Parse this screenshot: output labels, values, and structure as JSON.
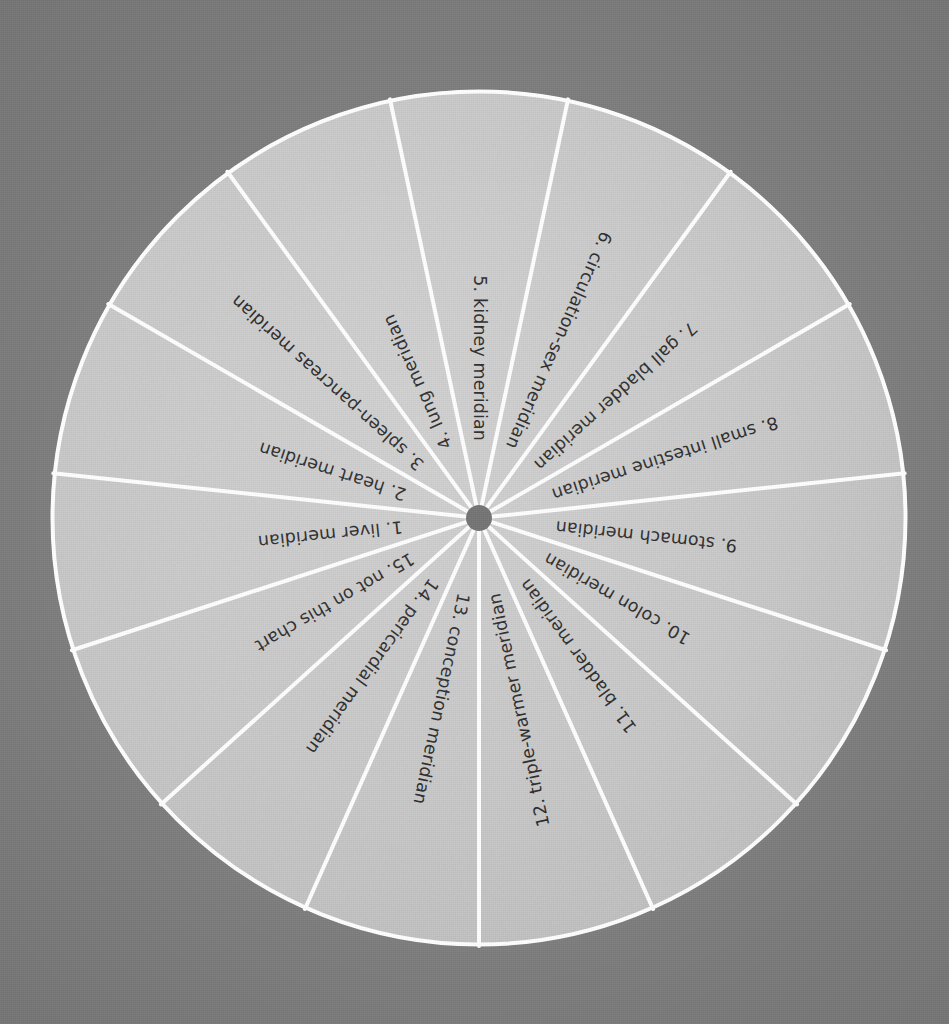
{
  "figure": {
    "kind": "radial-wheel-diagram",
    "title_visible": false,
    "sector_count": 15,
    "sector_angle_degrees": 24,
    "background_color": "#7e7e7e",
    "wheel_fill_color": "#c9c9c9",
    "divider_color": "#ffffff",
    "outline_color": "#ffffff",
    "hub_color": "#6f6f6f",
    "label_color": "#2a2a2a",
    "center_x": 479,
    "center_y": 518,
    "radius": 428,
    "hub_radius": 13
  },
  "chart_data": {
    "type": "pie",
    "title": "",
    "subtitle": "",
    "xlabel": "",
    "ylabel": "",
    "legend_position": "none",
    "grid": false,
    "equal_slices": true,
    "slice_value_degrees": 24,
    "categories": [
      "1. liver meridian",
      "2. heart meridian",
      "3. spleen-pancreas meridian",
      "4. lung meridian",
      "5. kidney meridian",
      "6. circulation-sex meridian",
      "7. gall bladder meridian",
      "8. small intestine meridian",
      "9. stomach meridian",
      "10. colon meridian",
      "11. bladder meridian",
      "12. triple-warmer meridian",
      "13. conception meridian",
      "14. pericardial meridian",
      "15. not on this chart"
    ],
    "values": [
      24,
      24,
      24,
      24,
      24,
      24,
      24,
      24,
      24,
      24,
      24,
      24,
      24,
      24,
      24
    ]
  },
  "sectors": [
    {
      "id": 1,
      "number": "1.",
      "name": "liver meridian",
      "label": "1.  liver meridian",
      "start_deg": 174,
      "end_deg": 198,
      "mid_deg": 186
    },
    {
      "id": 2,
      "number": "2.",
      "name": "heart meridian",
      "label": "2.  heart meridian",
      "start_deg": 150,
      "end_deg": 174,
      "mid_deg": 162
    },
    {
      "id": 3,
      "number": "3.",
      "name": "spleen-pancreas meridian",
      "label": "3.  spleen-pancreas meridian",
      "start_deg": 126,
      "end_deg": 150,
      "mid_deg": 138
    },
    {
      "id": 4,
      "number": "4.",
      "name": "lung meridian",
      "label": "4.  lung meridian",
      "start_deg": 102,
      "end_deg": 126,
      "mid_deg": 114
    },
    {
      "id": 5,
      "number": "5.",
      "name": "kidney meridian",
      "label": "5.  kidney meridian",
      "start_deg": 78,
      "end_deg": 102,
      "mid_deg": 90
    },
    {
      "id": 6,
      "number": "6.",
      "name": "circulation-sex meridian",
      "label": "6.  circulation-sex meridian",
      "start_deg": 54,
      "end_deg": 78,
      "mid_deg": 66
    },
    {
      "id": 7,
      "number": "7.",
      "name": "gall bladder meridian",
      "label": "7.  gall bladder meridian",
      "start_deg": 30,
      "end_deg": 54,
      "mid_deg": 42
    },
    {
      "id": 8,
      "number": "8.",
      "name": "small intestine meridian",
      "label": "8.  small intestine meridian",
      "start_deg": 6,
      "end_deg": 30,
      "mid_deg": 18
    },
    {
      "id": 9,
      "number": "9.",
      "name": "stomach meridian",
      "label": "9.  stomach meridian",
      "start_deg": -18,
      "end_deg": 6,
      "mid_deg": -6
    },
    {
      "id": 10,
      "number": "10.",
      "name": "colon meridian",
      "label": "10.  colon meridian",
      "start_deg": -42,
      "end_deg": -18,
      "mid_deg": -30
    },
    {
      "id": 11,
      "number": "11.",
      "name": "bladder meridian",
      "label": "11.  bladder meridian",
      "start_deg": -66,
      "end_deg": -42,
      "mid_deg": -54
    },
    {
      "id": 12,
      "number": "12.",
      "name": "triple-warmer meridian",
      "label": "12.  triple-warmer meridian",
      "start_deg": -90,
      "end_deg": -66,
      "mid_deg": -78
    },
    {
      "id": 13,
      "number": "13.",
      "name": "conception meridian",
      "label": "13.  conception meridian",
      "start_deg": 246,
      "end_deg": 270,
      "mid_deg": 258
    },
    {
      "id": 14,
      "number": "14.",
      "name": "pericardial meridian",
      "label": "14.  pericardial meridian",
      "start_deg": 222,
      "end_deg": 246,
      "mid_deg": 234
    },
    {
      "id": 15,
      "number": "15.",
      "name": "not on this chart",
      "label": "15.  not on this chart",
      "start_deg": 198,
      "end_deg": 222,
      "mid_deg": 210
    }
  ]
}
